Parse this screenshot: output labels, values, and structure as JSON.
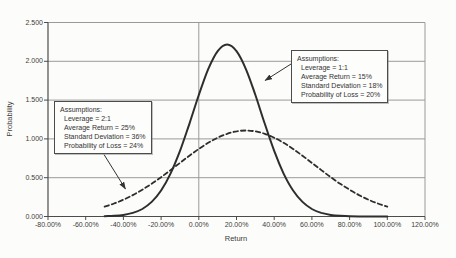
{
  "chart_data": {
    "type": "line",
    "title": "",
    "xlabel": "Return",
    "ylabel": "Probability",
    "xlim": [
      -0.8,
      1.2
    ],
    "ylim": [
      0.0,
      2.5
    ],
    "x_ticks": [
      "-80.00%",
      "-60.00%",
      "-40.00%",
      "-20.00%",
      "0.00%",
      "20.00%",
      "40.00%",
      "60.00%",
      "80.00%",
      "100.00%",
      "120.00%"
    ],
    "y_ticks": [
      "0.000",
      "0.500",
      "1.000",
      "1.500",
      "2.000",
      "2.500"
    ],
    "grid": {
      "horizontal_step": 0.5,
      "vertical_line_at_x": 0.0
    },
    "legend": "none",
    "series": [
      {
        "name": "Leverage = 1:1",
        "style": "solid",
        "color": "#2e2e2e",
        "mean": 0.15,
        "std_dev": 0.18,
        "x": [
          -0.5,
          -0.45,
          -0.4,
          -0.35,
          -0.3,
          -0.25,
          -0.2,
          -0.15,
          -0.1,
          -0.05,
          0.0,
          0.05,
          0.1,
          0.15,
          0.2,
          0.25,
          0.3,
          0.35,
          0.4,
          0.45,
          0.5,
          0.55,
          0.6,
          0.65,
          0.7,
          0.75,
          0.8,
          0.85,
          0.9,
          0.95,
          1.0
        ],
        "y": [
          0.003,
          0.009,
          0.021,
          0.047,
          0.097,
          0.188,
          0.335,
          0.553,
          0.845,
          1.195,
          1.566,
          1.899,
          2.132,
          2.216,
          2.132,
          1.899,
          1.566,
          1.195,
          0.845,
          0.553,
          0.335,
          0.188,
          0.097,
          0.047,
          0.021,
          0.009,
          0.003,
          0.001,
          0.0,
          0.0,
          0.0
        ]
      },
      {
        "name": "Leverage = 2:1",
        "style": "dashed",
        "color": "#2e2e2e",
        "mean": 0.25,
        "std_dev": 0.36,
        "x": [
          -0.5,
          -0.45,
          -0.4,
          -0.35,
          -0.3,
          -0.25,
          -0.2,
          -0.15,
          -0.1,
          -0.05,
          0.0,
          0.05,
          0.1,
          0.15,
          0.2,
          0.25,
          0.3,
          0.35,
          0.4,
          0.45,
          0.5,
          0.55,
          0.6,
          0.65,
          0.7,
          0.75,
          0.8,
          0.85,
          0.9,
          0.95,
          1.0
        ],
        "y": [
          0.126,
          0.167,
          0.217,
          0.276,
          0.345,
          0.422,
          0.507,
          0.598,
          0.691,
          0.783,
          0.871,
          0.95,
          1.016,
          1.066,
          1.097,
          1.108,
          1.097,
          1.066,
          1.016,
          0.95,
          0.871,
          0.783,
          0.691,
          0.598,
          0.507,
          0.422,
          0.345,
          0.276,
          0.217,
          0.167,
          0.126
        ]
      }
    ]
  },
  "annotations": {
    "box_right": {
      "title": "Assumptions:",
      "lines": [
        "Leverage = 1:1",
        "Average Return = 15%",
        "Standard Deviation = 18%",
        "Probability of Loss = 20%"
      ]
    },
    "box_left": {
      "title": "Assumptions:",
      "lines": [
        "Leverage = 2:1",
        "Average Return = 25%",
        "Standard Deviation = 36%",
        "Probability of Loss = 24%"
      ]
    }
  }
}
